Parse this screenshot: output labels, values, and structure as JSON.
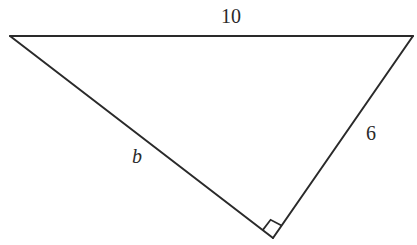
{
  "diagram": {
    "type": "right-triangle",
    "stroke_color": "#2a2a2a",
    "background": "#ffffff",
    "vertices": {
      "top_left": [
        10,
        36
      ],
      "top_right": [
        413,
        36
      ],
      "bottom": [
        273,
        238
      ]
    },
    "right_angle_at": "bottom",
    "labels": {
      "hypotenuse": "10",
      "left_leg": "b",
      "right_leg": "6"
    }
  }
}
